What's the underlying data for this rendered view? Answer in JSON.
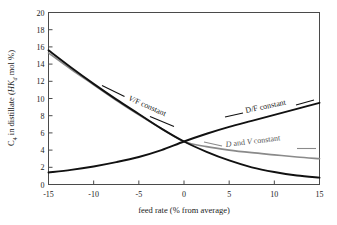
{
  "chart_data": {
    "type": "line",
    "title": "",
    "xlabel": "feed rate (% from average)",
    "ylabel": "C4 in distillate (HKd mol %)",
    "ylabel_parts": {
      "lead": "C",
      "lead_sub": "4",
      "mid": " in distillate (",
      "italic1": "HK",
      "italic1_sub": "d",
      "tail": " mol %)"
    },
    "xlim": [
      -15,
      15
    ],
    "ylim": [
      0,
      20
    ],
    "xticks": [
      "-15",
      "-10",
      "-5",
      "0",
      "5",
      "10",
      "15"
    ],
    "xtick_values": [
      -15,
      -10,
      -5,
      0,
      5,
      10,
      15
    ],
    "yticks": [
      "0",
      "2",
      "4",
      "6",
      "8",
      "10",
      "12",
      "14",
      "16",
      "18",
      "20"
    ],
    "ytick_values": [
      0,
      2,
      4,
      6,
      8,
      10,
      12,
      14,
      16,
      18,
      20
    ],
    "grid": false,
    "legend": "inline-annotations",
    "x": [
      -15,
      -12.5,
      -10,
      -7.5,
      -5,
      -2.5,
      0,
      2.5,
      5,
      7.5,
      10,
      12.5,
      15
    ],
    "series": [
      {
        "name": "V/F constant",
        "color": "#111111",
        "style": "solid",
        "values": [
          15.6,
          13.6,
          11.7,
          9.9,
          8.2,
          6.5,
          5.0,
          3.8,
          2.8,
          2.0,
          1.45,
          1.05,
          0.8
        ]
      },
      {
        "name": "D and V constant",
        "color": "#8a8a8a",
        "style": "solid",
        "values": [
          15.3,
          13.4,
          11.6,
          9.8,
          8.1,
          6.5,
          5.0,
          4.4,
          4.0,
          3.7,
          3.45,
          3.2,
          3.0
        ]
      },
      {
        "name": "D/F constant",
        "color": "#111111",
        "style": "solid",
        "values": [
          1.4,
          1.7,
          2.1,
          2.6,
          3.2,
          4.0,
          5.0,
          5.9,
          6.7,
          7.4,
          8.1,
          8.8,
          9.5
        ]
      }
    ],
    "annotations": [
      {
        "text": "V/F constant",
        "italic_prefix": "V",
        "rest": "/F constant",
        "anchor_x": -8.5,
        "anchor_y": 10.3
      },
      {
        "text": "D/F constant",
        "italic_prefix": "",
        "rest": "D/F constant",
        "anchor_x": 7.0,
        "anchor_y": 7.3
      },
      {
        "text": "D and V constant",
        "italic_prefix": "D",
        "rest": " and ",
        "anchor_x": 5.0,
        "anchor_y": 4.0
      }
    ]
  },
  "labels": {
    "v_f": {
      "italic": "V",
      "rest": "/F constant"
    },
    "d_f": {
      "full": "D/F constant"
    },
    "d_and_v": {
      "italic1": "D",
      "mid": " and ",
      "italic2": "V",
      "rest": " constant"
    }
  }
}
